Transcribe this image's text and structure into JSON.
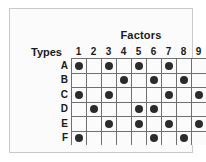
{
  "figure": {
    "column_axis_title": "Factors",
    "row_axis_title": "Types",
    "colors": {
      "dot": "#2b2b2b",
      "grid_line": "#6f6f6f",
      "frame_border": "#c9c9c9",
      "background": "#fbfbfb",
      "text": "#1a1a1a"
    }
  },
  "chart_data": {
    "type": "heatmap",
    "title": "",
    "xlabel": "Factors",
    "ylabel": "Types",
    "categories": [
      "1",
      "2",
      "3",
      "4",
      "5",
      "6",
      "7",
      "8",
      "9"
    ],
    "row_categories": [
      "A",
      "B",
      "C",
      "D",
      "E",
      "F"
    ],
    "grid": true,
    "legend": "none",
    "marker": "filled-circle",
    "series": [
      {
        "name": "A",
        "values": [
          1,
          0,
          1,
          0,
          1,
          0,
          1,
          0,
          0
        ]
      },
      {
        "name": "B",
        "values": [
          0,
          0,
          0,
          1,
          0,
          1,
          0,
          1,
          0
        ]
      },
      {
        "name": "C",
        "values": [
          1,
          0,
          1,
          0,
          0,
          0,
          1,
          0,
          1
        ]
      },
      {
        "name": "D",
        "values": [
          0,
          1,
          0,
          0,
          1,
          1,
          0,
          0,
          0
        ]
      },
      {
        "name": "E",
        "values": [
          0,
          0,
          1,
          0,
          1,
          0,
          1,
          0,
          1
        ]
      },
      {
        "name": "F",
        "values": [
          1,
          0,
          0,
          0,
          0,
          1,
          0,
          1,
          0
        ]
      }
    ],
    "marked_pairs": [
      {
        "type": "A",
        "factors": [
          1,
          3,
          5,
          7
        ]
      },
      {
        "type": "B",
        "factors": [
          4,
          6,
          8
        ]
      },
      {
        "type": "C",
        "factors": [
          1,
          3,
          7,
          9
        ]
      },
      {
        "type": "D",
        "factors": [
          2,
          5,
          6
        ]
      },
      {
        "type": "E",
        "factors": [
          3,
          5,
          7,
          9
        ]
      },
      {
        "type": "F",
        "factors": [
          1,
          6,
          8
        ]
      }
    ]
  }
}
